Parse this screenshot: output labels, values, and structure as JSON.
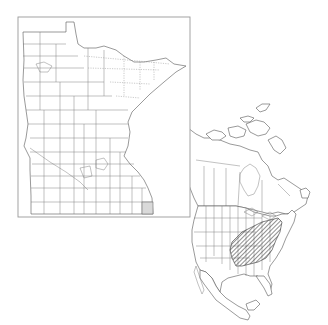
{
  "map": {
    "type": "distribution-map",
    "inset": {
      "region": "Minnesota",
      "subdivisions": "counties",
      "highlighted_counties": [
        {
          "name": "Houston",
          "fill": "#d9d9d9"
        }
      ]
    },
    "overview": {
      "region": "North America",
      "subdivisions": "states and provinces",
      "range": {
        "area": "Eastern United States",
        "pattern": "diagonal-hatch",
        "color": "#333333"
      }
    },
    "colors": {
      "background": "#ffffff",
      "outline": "#555555",
      "frame": "#999999",
      "county_shade": "#d9d9d9",
      "hatch": "#333333"
    }
  }
}
